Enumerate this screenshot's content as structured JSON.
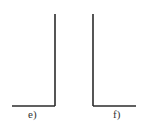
{
  "figures": [
    {
      "id": "e",
      "label": "e)",
      "shape": "L-mirrored",
      "color": "#2b2b2b"
    },
    {
      "id": "f",
      "label": "f)",
      "shape": "L",
      "color": "#2b2b2b"
    }
  ]
}
